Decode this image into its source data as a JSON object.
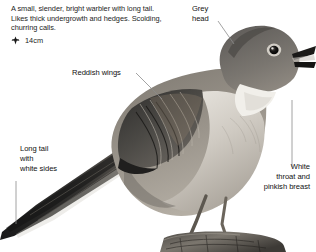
{
  "plate": {
    "description": "A small, slender, bright warbler with long tail. Likes thick undergrowth and hedges. Scolding, churring calls.",
    "size_label": "14cm",
    "size_icon": "size-arrows-icon",
    "background_color": "#ffffff",
    "text_color": "#242424",
    "leader_line_color": "#8c8c8c"
  },
  "callouts": [
    {
      "id": "grey-head",
      "text": "Grey\nhead"
    },
    {
      "id": "reddish-wings",
      "text": "Reddish wings"
    },
    {
      "id": "long-tail",
      "text": "Long tail\nwith\nwhite sides"
    },
    {
      "id": "white-throat",
      "text": "White\nthroat and\npinkish breast"
    }
  ],
  "illustration": {
    "subject": "perched-warbler",
    "pose": "perched on post, facing right, beak open",
    "palette": {
      "wing_dark": "#3a3a3a",
      "back": "#8f8a82",
      "head_grey": "#6e6b68",
      "breast_pale": "#d9d5cf",
      "throat_white": "#f2f0ec",
      "tail_dark": "#2b2b2b",
      "post": "#5a5751"
    }
  }
}
